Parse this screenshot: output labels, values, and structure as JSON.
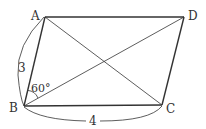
{
  "figure": {
    "type": "parallelogram",
    "vertices": {
      "A": {
        "label": "A",
        "x": 45,
        "y": 17
      },
      "B": {
        "label": "B",
        "x": 24,
        "y": 106
      },
      "C": {
        "label": "C",
        "x": 162,
        "y": 105
      },
      "D": {
        "label": "D",
        "x": 184,
        "y": 17
      }
    },
    "diagonals": [
      "AC",
      "BD"
    ],
    "measurements": {
      "side_AB": "3",
      "side_BC": "4",
      "angle_ABD": "60°"
    },
    "colors": {
      "stroke": "#333333",
      "background": "#ffffff"
    }
  }
}
